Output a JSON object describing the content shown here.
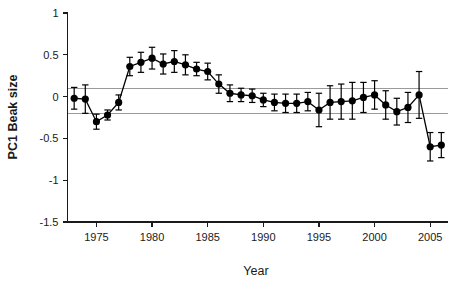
{
  "chart_data": {
    "type": "line",
    "title": "",
    "xlabel": "Year",
    "ylabel": "PC1 Beak size",
    "xlim": [
      1972.4,
      2006.6
    ],
    "ylim": [
      -1.5,
      1.0
    ],
    "grid": false,
    "legend": null,
    "x_ticks": [
      1975,
      1980,
      1985,
      1990,
      1995,
      2000,
      2005
    ],
    "x_tick_labels": [
      "1975",
      "1980",
      "1985",
      "1990",
      "1995",
      "2000",
      "2005"
    ],
    "y_ticks": [
      1,
      0.5,
      0,
      -0.5,
      -1,
      -1.5
    ],
    "y_tick_labels": [
      "1",
      "0.5",
      "0",
      "-0.5",
      "-1",
      "-1.5"
    ],
    "marker": "filled-circle",
    "error_bars": "vertical-with-caps",
    "reference_lines": [
      {
        "name": "upper-reference-line",
        "y": 0.1,
        "color": "#9a9a9a"
      },
      {
        "name": "lower-reference-line",
        "y": -0.2,
        "color": "#9a9a9a"
      }
    ],
    "series": [
      {
        "name": "PC1 Beak size",
        "color": "#000000",
        "x": [
          1973,
          1974,
          1975,
          1976,
          1977,
          1978,
          1979,
          1980,
          1981,
          1982,
          1983,
          1984,
          1985,
          1986,
          1987,
          1988,
          1989,
          1990,
          1991,
          1992,
          1993,
          1994,
          1995,
          1996,
          1997,
          1998,
          1999,
          2000,
          2001,
          2002,
          2003,
          2004,
          2005,
          2006
        ],
        "values": [
          -0.02,
          -0.03,
          -0.3,
          -0.22,
          -0.07,
          0.36,
          0.41,
          0.46,
          0.39,
          0.42,
          0.38,
          0.33,
          0.3,
          0.15,
          0.04,
          0.02,
          0.01,
          -0.04,
          -0.07,
          -0.08,
          -0.08,
          -0.06,
          -0.16,
          -0.07,
          -0.06,
          -0.05,
          -0.01,
          0.02,
          -0.1,
          -0.18,
          -0.13,
          0.02,
          -0.6,
          -0.58
        ],
        "err_upper": [
          0.13,
          0.17,
          0.09,
          0.06,
          0.09,
          0.11,
          0.12,
          0.13,
          0.12,
          0.13,
          0.12,
          0.08,
          0.1,
          0.11,
          0.1,
          0.08,
          0.08,
          0.08,
          0.1,
          0.11,
          0.11,
          0.11,
          0.2,
          0.2,
          0.21,
          0.22,
          0.18,
          0.17,
          0.17,
          0.16,
          0.18,
          0.28,
          0.17,
          0.15
        ],
        "err_lower": [
          0.13,
          0.17,
          0.09,
          0.06,
          0.09,
          0.11,
          0.12,
          0.13,
          0.12,
          0.13,
          0.12,
          0.08,
          0.1,
          0.11,
          0.1,
          0.08,
          0.08,
          0.08,
          0.1,
          0.11,
          0.11,
          0.11,
          0.2,
          0.2,
          0.21,
          0.22,
          0.18,
          0.17,
          0.17,
          0.16,
          0.18,
          0.28,
          0.17,
          0.15
        ]
      }
    ]
  }
}
